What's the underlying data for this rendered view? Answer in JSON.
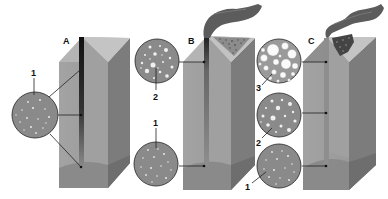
{
  "diagram": {
    "panels": [
      {
        "id": "A",
        "label": "A",
        "has_plume": false,
        "insets": [
          {
            "number": "1",
            "description": "sparse small bubbles",
            "position": "middle"
          }
        ]
      },
      {
        "id": "B",
        "label": "B",
        "has_plume": true,
        "insets": [
          {
            "number": "2",
            "description": "medium bubbles",
            "position": "top"
          },
          {
            "number": "1",
            "description": "sparse small bubbles",
            "position": "bottom"
          }
        ]
      },
      {
        "id": "C",
        "label": "C",
        "has_plume": true,
        "insets": [
          {
            "number": "3",
            "description": "large foam bubbles",
            "position": "top"
          },
          {
            "number": "2",
            "description": "medium bubbles",
            "position": "middle"
          },
          {
            "number": "1",
            "description": "sparse small bubbles",
            "position": "bottom"
          }
        ]
      }
    ],
    "colors": {
      "front_face": "#9a9a9a",
      "front_face_light": "#a8a8a8",
      "side_face": "#7a7a7a",
      "top_face": "#b8b8b8",
      "conduit": "#1a1a1a",
      "inset_fill": "#8a8a8a",
      "plume": "#5a5a5a",
      "background": "#ffffff"
    }
  }
}
